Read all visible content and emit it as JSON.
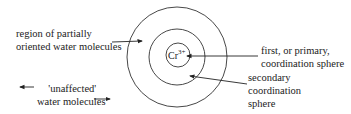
{
  "diagram": {
    "center_ion": {
      "symbol": "Cr",
      "charge": "3+"
    },
    "labels": {
      "oriented_region": [
        "region of partially",
        "oriented water molecules"
      ],
      "unaffected": [
        "'unaffected'",
        "water molecules"
      ],
      "primary_sphere": [
        "first, or primary,",
        "coordination sphere"
      ],
      "secondary_sphere": [
        "secondary",
        "coordination",
        "sphere"
      ]
    },
    "circles": [
      {
        "name": "primary-coordination-sphere",
        "cx": 178,
        "cy": 55,
        "r": 12
      },
      {
        "name": "secondary-coordination-sphere",
        "cx": 177,
        "cy": 57,
        "r": 28
      },
      {
        "name": "partially-oriented-region",
        "cx": 177,
        "cy": 57,
        "r": 50
      }
    ],
    "stroke_color": "#333333"
  }
}
